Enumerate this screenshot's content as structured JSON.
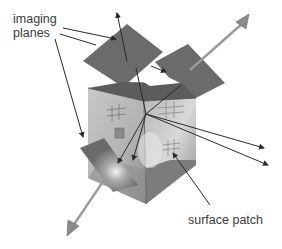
{
  "labels": {
    "imaging_planes_line1": "imaging",
    "imaging_planes_line2": "planes",
    "surface_patch": "surface patch"
  },
  "colors": {
    "background": "#ffffff",
    "plane_fill": "#6b6b6b",
    "cube_top": "#5e5e5e",
    "cube_front": "#b4b4b4",
    "cube_right": "#a8a8a8",
    "ray_line": "#2a2a2a",
    "normal_arrow": "#9a9a9a",
    "text": "#3a3a3a"
  },
  "elements": {
    "imaging_planes_count": 3,
    "normal_arrows_count": 2,
    "scene": "box with patterned interior surface patch viewed by multiple cameras"
  }
}
